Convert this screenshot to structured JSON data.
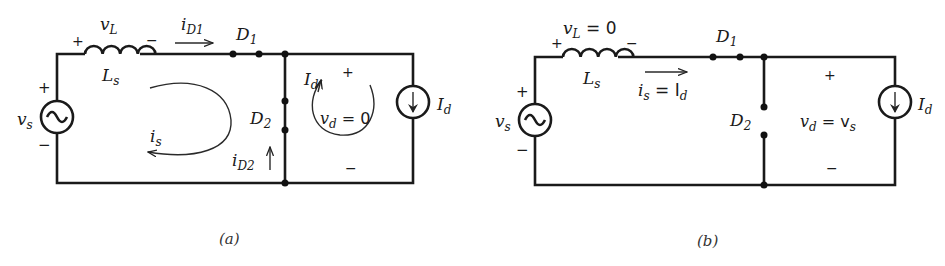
{
  "circuit_a": {
    "caption": "(a)",
    "source": {
      "name": "v",
      "sub": "s",
      "plus": "+",
      "minus": "−"
    },
    "inductor": {
      "v_name": "v",
      "v_sub": "L",
      "name": "L",
      "sub": "s",
      "plus": "+",
      "minus": "−"
    },
    "i_d1": {
      "name": "i",
      "sub": "D1"
    },
    "d1": {
      "name": "D",
      "sub": "1"
    },
    "d2": {
      "name": "D",
      "sub": "2"
    },
    "i_d2": {
      "name": "i",
      "sub": "D2"
    },
    "loop_current": {
      "name": "i",
      "sub": "s"
    },
    "id_loop": {
      "name": "I",
      "sub": "d"
    },
    "output_voltage": {
      "name": "v",
      "sub": "d",
      "eq": " = 0",
      "plus": "+",
      "minus": "−"
    },
    "load": {
      "name": "I",
      "sub": "d"
    }
  },
  "circuit_b": {
    "caption": "(b)",
    "source": {
      "name": "v",
      "sub": "s",
      "plus": "+",
      "minus": "−"
    },
    "inductor": {
      "v_name": "v",
      "v_sub": "L",
      "v_eq": " = 0",
      "name": "L",
      "sub": "s",
      "plus": "+",
      "minus": "−"
    },
    "current": {
      "name": "i",
      "sub": "s",
      "eq": " = I",
      "eq_sub": "d"
    },
    "d1": {
      "name": "D",
      "sub": "1"
    },
    "d2": {
      "name": "D",
      "sub": "2"
    },
    "output_voltage": {
      "name": "v",
      "sub": "d",
      "eq": " = v",
      "eq_sub": "s",
      "plus": "+",
      "minus": "−"
    },
    "load": {
      "name": "I",
      "sub": "d"
    }
  }
}
